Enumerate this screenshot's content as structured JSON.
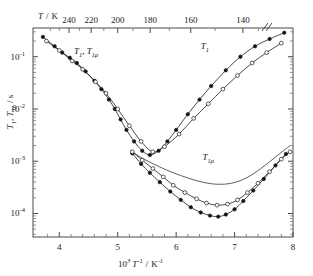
{
  "chart_data": {
    "type": "line",
    "title": "",
    "xlabel": "10^3 T^-1 / K^-1",
    "xlabel_parts": {
      "pre": "10",
      "sup1": "3",
      "var": "T",
      "sup2": "-1",
      "slash": "/",
      "unit": "K",
      "sup3": "-1"
    },
    "ylabel": "T1, T1ρ / s",
    "ylabel_parts": {
      "t": "T",
      "sub1": "1",
      "comma": ", ",
      "t2": "T",
      "sub2": "1ρ",
      "slash": " / s"
    },
    "xlim": [
      3.55,
      8.0
    ],
    "ylim_log": [
      -4.45,
      -0.45
    ],
    "x_ticks": [
      4,
      5,
      6,
      7,
      8
    ],
    "x_tick_labels": [
      "4",
      "5",
      "6",
      "7",
      "8"
    ],
    "x_minor_ticks": [
      3.8,
      4.2,
      4.4,
      4.6,
      4.8,
      5.2,
      5.4,
      5.6,
      5.8,
      6.2,
      6.4,
      6.6,
      6.8,
      7.2,
      7.4,
      7.6,
      7.8
    ],
    "y_ticks_exp": [
      -1,
      -2,
      -3,
      -4
    ],
    "y_tick_labels": [
      "10",
      "10",
      "10",
      "10"
    ],
    "y_tick_exponents": [
      "-1",
      "-2",
      "-3",
      "-4"
    ],
    "top_axis_label": "T / K",
    "top_axis_title_parts": {
      "var": "T",
      "slash": "/",
      "unit": "K"
    },
    "top_ticks_T": [
      240,
      220,
      200,
      180,
      160,
      140
    ],
    "top_tick_labels": [
      "240",
      "220",
      "200",
      "180",
      "160",
      "140"
    ],
    "top_minor_T": [
      260,
      250,
      230,
      210,
      190,
      170,
      150,
      135
    ],
    "axis_break_marker": "//",
    "grid": false,
    "legend": "none",
    "annotations": [
      {
        "id": "ann-t1-t1rho",
        "text": "T1, T1ρ",
        "x": 4.25,
        "y_log": -0.95
      },
      {
        "id": "ann-t1",
        "text": "T1",
        "x": 6.42,
        "y_log": -0.86
      },
      {
        "id": "ann-t1rho",
        "text": "T1ρ",
        "x": 6.45,
        "y_log": -2.97
      }
    ],
    "series": [
      {
        "name": "T1 filled",
        "marker": "filled-circle",
        "x": [
          3.72,
          3.92,
          4.05,
          4.18,
          4.3,
          4.45,
          4.6,
          4.72,
          4.85,
          4.95,
          5.05,
          5.15,
          5.28,
          5.42,
          5.55,
          5.7,
          5.85,
          6.0,
          6.2,
          6.4,
          6.6,
          6.85,
          7.1,
          7.35,
          7.6,
          7.85
        ],
        "y_log": [
          -0.62,
          -0.8,
          -0.92,
          -1.02,
          -1.12,
          -1.28,
          -1.46,
          -1.62,
          -1.82,
          -2.0,
          -2.2,
          -2.4,
          -2.62,
          -2.8,
          -2.88,
          -2.8,
          -2.62,
          -2.4,
          -2.1,
          -1.82,
          -1.56,
          -1.26,
          -1.0,
          -0.8,
          -0.66,
          -0.54
        ]
      },
      {
        "name": "T1 open",
        "marker": "open-circle",
        "x": [
          3.78,
          4.0,
          4.22,
          4.4,
          4.62,
          4.8,
          5.0,
          5.2,
          5.4,
          5.6,
          5.8,
          6.05,
          6.3,
          6.55,
          6.8,
          7.05,
          7.3,
          7.55,
          7.8
        ],
        "y_log": [
          -0.7,
          -0.88,
          -1.08,
          -1.24,
          -1.48,
          -1.7,
          -2.0,
          -2.32,
          -2.62,
          -2.82,
          -2.72,
          -2.48,
          -2.18,
          -1.9,
          -1.62,
          -1.36,
          -1.12,
          -0.92,
          -0.74
        ]
      },
      {
        "name": "T1rho filled",
        "marker": "filled-circle",
        "x": [
          5.25,
          5.4,
          5.55,
          5.72,
          5.9,
          6.08,
          6.25,
          6.42,
          6.58,
          6.72,
          6.85,
          7.0,
          7.15,
          7.32,
          7.5,
          7.7,
          7.88
        ],
        "y_log": [
          -2.85,
          -3.05,
          -3.22,
          -3.4,
          -3.58,
          -3.74,
          -3.88,
          -3.98,
          -4.04,
          -4.06,
          -4.02,
          -3.92,
          -3.76,
          -3.56,
          -3.34,
          -3.08,
          -2.86
        ]
      },
      {
        "name": "T1rho open",
        "marker": "open-circle",
        "x": [
          5.25,
          5.42,
          5.6,
          5.78,
          5.95,
          6.15,
          6.35,
          6.52,
          6.7,
          6.88,
          7.05,
          7.22,
          7.4,
          7.6,
          7.8,
          7.95
        ],
        "y_log": [
          -2.82,
          -2.98,
          -3.14,
          -3.3,
          -3.46,
          -3.6,
          -3.72,
          -3.8,
          -3.84,
          -3.82,
          -3.74,
          -3.6,
          -3.42,
          -3.2,
          -2.96,
          -2.82
        ]
      },
      {
        "name": "T1rho upper-line",
        "marker": "none",
        "x": [
          5.22,
          5.45,
          5.7,
          5.95,
          6.2,
          6.45,
          6.7,
          6.95,
          7.2,
          7.45,
          7.7,
          7.95
        ],
        "y_log": [
          -2.8,
          -2.96,
          -3.1,
          -3.22,
          -3.32,
          -3.4,
          -3.44,
          -3.42,
          -3.32,
          -3.14,
          -2.92,
          -2.7
        ]
      }
    ]
  },
  "figure": {
    "background": "#ffffff",
    "line_color": "#1a1a1a",
    "marker_fill": "#111111",
    "marker_open_fill": "#ffffff"
  }
}
